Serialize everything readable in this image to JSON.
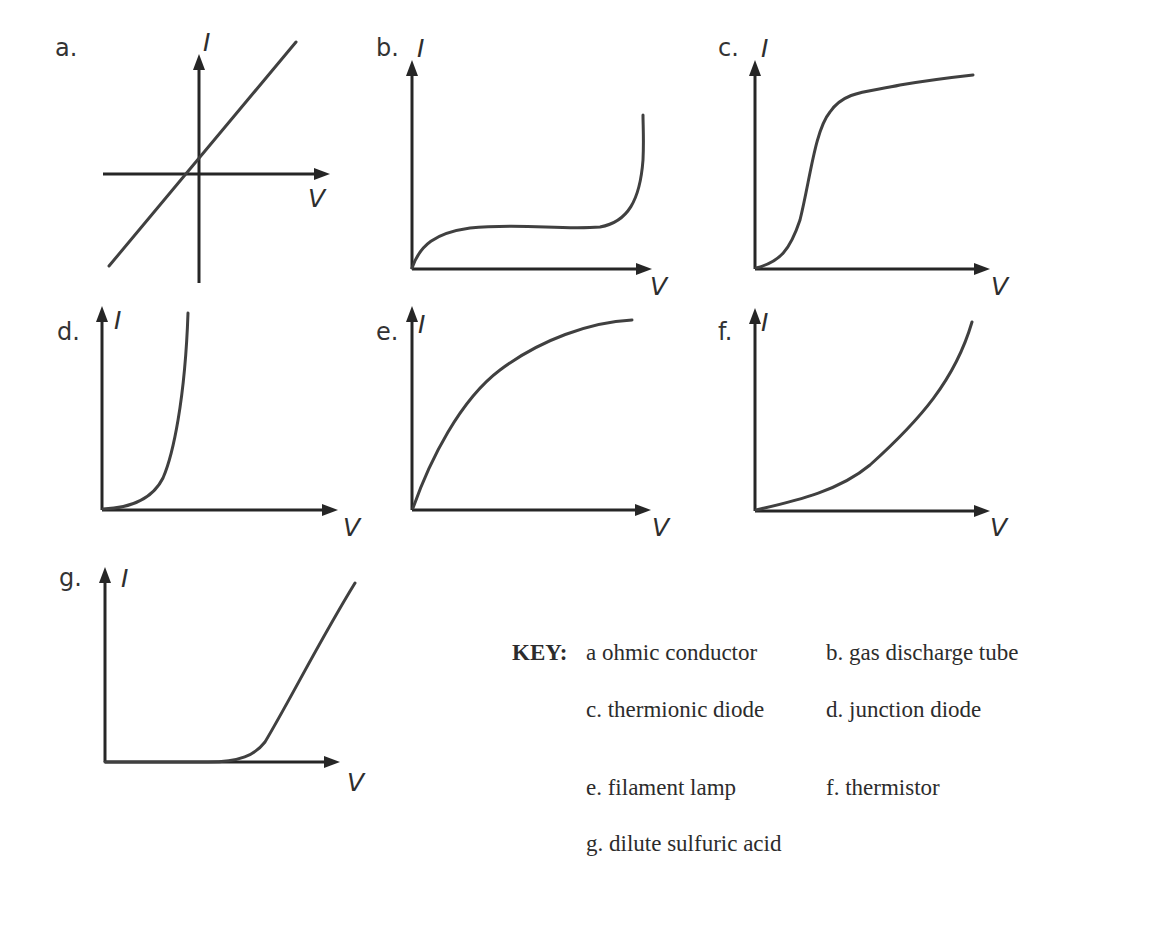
{
  "figure": {
    "axis_labels": {
      "y": "I",
      "x": "V"
    },
    "colors": {
      "axis": "#262626",
      "curve": "#404040",
      "text": "#2c2c2c",
      "background": "#ffffff"
    },
    "panels": [
      {
        "id": "a",
        "label": "a.",
        "device": "ohmic conductor",
        "label_pos": [
          55,
          34
        ],
        "ylabel_pos": [
          203,
          28
        ],
        "xlabel_pos": [
          308,
          184
        ],
        "origin": [
          199,
          174
        ],
        "x_axis": [
          103,
          330
        ],
        "y_axis": [
          283,
          54
        ],
        "curve": [
          [
            109,
            266
          ],
          [
            296,
            42
          ]
        ],
        "curve_type": "line",
        "shape": "straight line through origin, equal slope in both quadrants"
      },
      {
        "id": "b",
        "label": "b.",
        "device": "gas discharge tube",
        "label_pos": [
          376,
          34
        ],
        "ylabel_pos": [
          417,
          34
        ],
        "xlabel_pos": [
          650,
          272
        ],
        "origin": [
          412,
          269
        ],
        "x_axis": [
          412,
          652
        ],
        "y_axis": [
          269,
          60
        ],
        "curve": "M412,268 C420,245 435,233 470,228 C520,223 560,230 600,227 C628,222 640,200 643,160 C644,140 643,125 643,115",
        "curve_type": "path",
        "shape": "rises, plateaus (saturation), then rises steeply at breakdown"
      },
      {
        "id": "c",
        "label": "c.",
        "device": "thermionic diode",
        "label_pos": [
          718,
          34
        ],
        "ylabel_pos": [
          761,
          34
        ],
        "xlabel_pos": [
          991,
          272
        ],
        "origin": [
          755,
          269
        ],
        "x_axis": [
          755,
          990
        ],
        "y_axis": [
          269,
          60
        ],
        "curve": "M756,268 C780,262 790,250 800,220 C810,180 815,130 830,112 C845,90 870,92 900,85 C930,80 955,77 973,75",
        "curve_type": "path",
        "shape": "S-shaped rise then saturation plateau"
      },
      {
        "id": "d",
        "label": "d.",
        "device": "junction diode",
        "label_pos": [
          57,
          318
        ],
        "ylabel_pos": [
          114,
          306
        ],
        "xlabel_pos": [
          343,
          513
        ],
        "origin": [
          102,
          510
        ],
        "x_axis": [
          102,
          338
        ],
        "y_axis": [
          510,
          306
        ],
        "curve": "M103,509 C130,508 152,500 163,478 C173,455 185,400 188,313",
        "curve_type": "path",
        "shape": "near-zero until threshold, then exponential rise"
      },
      {
        "id": "e",
        "label": "e.",
        "device": "filament lamp",
        "label_pos": [
          376,
          318
        ],
        "ylabel_pos": [
          418,
          310
        ],
        "xlabel_pos": [
          652,
          513
        ],
        "origin": [
          412,
          510
        ],
        "x_axis": [
          412,
          651
        ],
        "y_axis": [
          510,
          306
        ],
        "curve": "M413,508 C430,460 460,400 500,370 C540,340 590,322 632,320",
        "curve_type": "path",
        "shape": "concave-down curve, gradient decreasing as V increases"
      },
      {
        "id": "f",
        "label": "f.",
        "device": "thermistor",
        "label_pos": [
          718,
          318
        ],
        "ylabel_pos": [
          761,
          308
        ],
        "xlabel_pos": [
          990,
          513
        ],
        "origin": [
          755,
          511
        ],
        "x_axis": [
          755,
          990
        ],
        "y_axis": [
          511,
          308
        ],
        "curve": "M756,510 C800,500 840,490 870,465 C920,420 955,380 972,322",
        "curve_type": "path",
        "shape": "concave-up curve, gradient increasing as V increases"
      },
      {
        "id": "g",
        "label": "g.",
        "device": "dilute sulfuric acid",
        "label_pos": [
          59,
          564
        ],
        "ylabel_pos": [
          121,
          564
        ],
        "xlabel_pos": [
          347,
          768
        ],
        "origin": [
          105,
          762
        ],
        "x_axis": [
          105,
          340
        ],
        "y_axis": [
          762,
          567
        ],
        "curve": "M105,762 L208,762 C240,762 255,755 265,742 C290,700 320,640 355,583",
        "curve_type": "path",
        "shape": "zero current until threshold voltage, then straight-line rise"
      }
    ]
  },
  "key": {
    "title": "KEY:",
    "entries": [
      {
        "text": "a ohmic conductor",
        "pos": [
          586,
          640
        ]
      },
      {
        "text": "b. gas discharge tube",
        "pos": [
          826,
          640
        ]
      },
      {
        "text": "c. thermionic diode",
        "pos": [
          586,
          697
        ]
      },
      {
        "text": "d. junction diode",
        "pos": [
          826,
          697
        ]
      },
      {
        "text": "e. filament lamp",
        "pos": [
          586,
          775
        ]
      },
      {
        "text": "f. thermistor",
        "pos": [
          826,
          775
        ]
      },
      {
        "text": "g. dilute sulfuric acid",
        "pos": [
          586,
          831
        ]
      }
    ],
    "title_pos": [
      512,
      640
    ]
  }
}
